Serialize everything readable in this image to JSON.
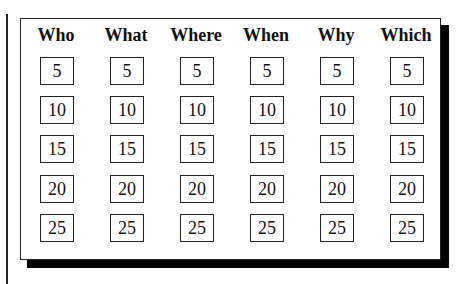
{
  "columns": [
    {
      "header": "Who",
      "values": [
        "5",
        "10",
        "15",
        "20",
        "25"
      ]
    },
    {
      "header": "What",
      "values": [
        "5",
        "10",
        "15",
        "20",
        "25"
      ]
    },
    {
      "header": "Where",
      "values": [
        "5",
        "10",
        "15",
        "20",
        "25"
      ]
    },
    {
      "header": "When",
      "values": [
        "5",
        "10",
        "15",
        "20",
        "25"
      ]
    },
    {
      "header": "Why",
      "values": [
        "5",
        "10",
        "15",
        "20",
        "25"
      ]
    },
    {
      "header": "Which",
      "values": [
        "5",
        "10",
        "15",
        "20",
        "25"
      ]
    }
  ]
}
